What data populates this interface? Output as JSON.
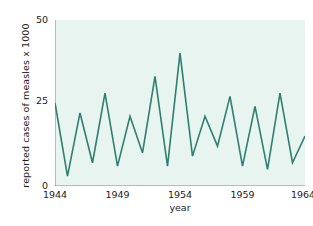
{
  "chart_data": {
    "type": "line",
    "title": "",
    "xlabel": "year",
    "ylabel": "reported cases of measles x 1000",
    "xlim": [
      1944,
      1964
    ],
    "ylim": [
      0,
      50
    ],
    "xticks": [
      1944,
      1949,
      1954,
      1959,
      1964
    ],
    "yticks": [
      0,
      25,
      50
    ],
    "grid": false,
    "legend": null,
    "line_color": "#2f7f6f",
    "plot_background": "#e7f4ef",
    "x": [
      1944,
      1945,
      1946,
      1947,
      1948,
      1949,
      1950,
      1951,
      1952,
      1953,
      1954,
      1955,
      1956,
      1957,
      1958,
      1959,
      1960,
      1961,
      1962,
      1963,
      1964
    ],
    "values": [
      25,
      3,
      22,
      7,
      28,
      6,
      21,
      10,
      33,
      6,
      40,
      9,
      21,
      12,
      27,
      6,
      24,
      5,
      28,
      7,
      15
    ],
    "series": [
      {
        "name": "reported cases of measles x 1000",
        "values": [
          25,
          3,
          22,
          7,
          28,
          6,
          21,
          10,
          33,
          6,
          40,
          9,
          21,
          12,
          27,
          6,
          24,
          5,
          28,
          7,
          15
        ]
      }
    ]
  },
  "axis": {
    "y_tick_labels": [
      "50",
      "25",
      "0"
    ],
    "x_tick_labels": [
      "1944",
      "1949",
      "1954",
      "1959",
      "1964"
    ],
    "y_title": "reported cases of measles x 1000",
    "x_title": "year"
  }
}
